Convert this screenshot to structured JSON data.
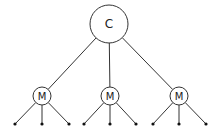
{
  "diagram": {
    "type": "tree",
    "root": {
      "label": "C",
      "cx": 109,
      "cy": 24,
      "r": 19
    },
    "children": [
      {
        "label": "M",
        "cx": 42,
        "cy": 96,
        "r": 9,
        "leaves": [
          {
            "x": 15,
            "y": 124
          },
          {
            "x": 42,
            "y": 124
          },
          {
            "x": 69,
            "y": 124
          }
        ]
      },
      {
        "label": "M",
        "cx": 110,
        "cy": 96,
        "r": 9,
        "leaves": [
          {
            "x": 84,
            "y": 124
          },
          {
            "x": 110,
            "y": 124
          },
          {
            "x": 136,
            "y": 124
          }
        ]
      },
      {
        "label": "M",
        "cx": 179,
        "cy": 96,
        "r": 9,
        "leaves": [
          {
            "x": 153,
            "y": 124
          },
          {
            "x": 179,
            "y": 124
          },
          {
            "x": 206,
            "y": 124
          }
        ]
      }
    ],
    "colors": {
      "stroke": "#333333",
      "fill": "#ffffff",
      "text": "#222222"
    }
  }
}
